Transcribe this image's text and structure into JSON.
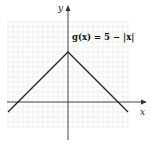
{
  "chart_data": {
    "type": "line",
    "title": "",
    "xlabel": "x",
    "ylabel": "y",
    "xlim": [
      -6,
      6
    ],
    "ylim": [
      -2.6,
      8
    ],
    "grid": true,
    "series": [
      {
        "name": "g(x) = 5 − |x|",
        "x": [
          -6,
          0,
          6
        ],
        "y": [
          -1,
          5,
          -1
        ]
      }
    ],
    "annotations": [
      {
        "text": "g(x) = 5 − |x|",
        "near": "top-right of vertex"
      }
    ]
  },
  "labels": {
    "x_axis": "x",
    "y_axis": "y",
    "equation": "g(x) = 5 − |x|"
  },
  "colors": {
    "curve": "#222222",
    "grid": "#e6e6e6",
    "axis": "#333333"
  }
}
